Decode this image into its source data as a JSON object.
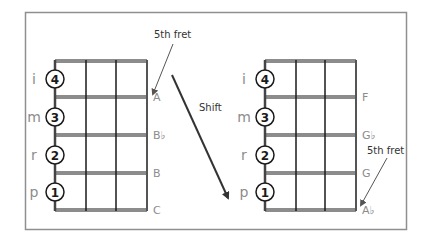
{
  "diagram": {
    "colors": {
      "frame": "#8f8f8f",
      "grid": "#1a1a1a",
      "label": "#8c8c8c",
      "arrow": "#333333"
    },
    "left_panel": {
      "annotation": "5th fret",
      "fingers": [
        {
          "hand_label": "i",
          "finger_number": "4"
        },
        {
          "hand_label": "m",
          "finger_number": "3"
        },
        {
          "hand_label": "r",
          "finger_number": "2"
        },
        {
          "hand_label": "p",
          "finger_number": "1"
        }
      ],
      "notes": [
        "A",
        "B♭",
        "B",
        "C"
      ]
    },
    "shift": {
      "label": "Shift"
    },
    "right_panel": {
      "annotation": "5th fret",
      "fingers": [
        {
          "hand_label": "i",
          "finger_number": "4"
        },
        {
          "hand_label": "m",
          "finger_number": "3"
        },
        {
          "hand_label": "r",
          "finger_number": "2"
        },
        {
          "hand_label": "p",
          "finger_number": "1"
        }
      ],
      "notes": [
        "F",
        "G♭",
        "G",
        "A♭"
      ]
    }
  }
}
